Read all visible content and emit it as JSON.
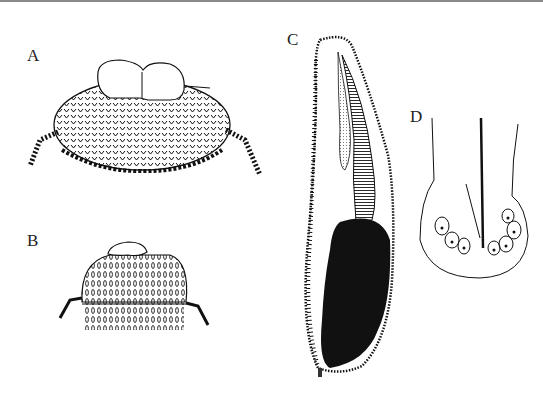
{
  "figure": {
    "panels": [
      {
        "label": "A",
        "description": "oval ciliated body with two rounded bulbs on top and lateral tufts"
      },
      {
        "label": "B",
        "description": "dome-shaped ciliated body with flat cap and lateral tufts"
      },
      {
        "label": "C",
        "description": "elongated curved body with striated margin and dark internal mass"
      },
      {
        "label": "D",
        "description": "U-shaped outline with central rod and cluster of nucleated cells"
      }
    ],
    "colors": {
      "ink": "#111111",
      "paper": "#ffffff",
      "top_rule": "#8a8a8a"
    }
  }
}
